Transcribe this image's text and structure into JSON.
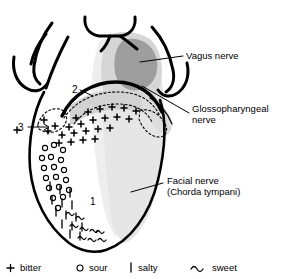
{
  "figure": {
    "type": "anatomical-diagram",
    "background_color": "#ffffff",
    "stroke_color": "#000000",
    "shading": {
      "light_gray": "#e4e4e4",
      "mid_gray": "#cfcfcf",
      "dark_gray": "#9a9a9a"
    }
  },
  "labels": {
    "vagus": {
      "line1": "Vagus nerve",
      "line2": ""
    },
    "glossopharyngeal": {
      "line1": "Glossopharyngeal",
      "line2": "nerve"
    },
    "facial": {
      "line1": "Facial nerve",
      "line2": "(Chorda tympani)"
    }
  },
  "region_numbers": [
    {
      "id": "1",
      "text": "1"
    },
    {
      "id": "2",
      "text": "2"
    },
    {
      "id": "3",
      "text": "3"
    }
  ],
  "legend": {
    "items": [
      {
        "symbol": "+",
        "icon_name": "plus-symbol",
        "label": "bitter"
      },
      {
        "symbol": "○",
        "icon_name": "circle-symbol",
        "label": "sour"
      },
      {
        "symbol": "|",
        "icon_name": "bar-symbol",
        "label": "salty"
      },
      {
        "symbol": "∿",
        "icon_name": "wave-symbol",
        "label": "sweet"
      }
    ]
  }
}
